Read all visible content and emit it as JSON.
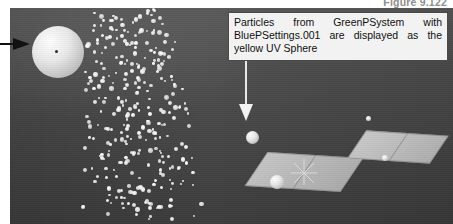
{
  "figure": {
    "caption": "Figure 9.122"
  },
  "viewport": {
    "name": "blender-3d-viewport",
    "background_color": "#4d4d4d",
    "grid_line_color": "#2e2e2e",
    "shading": "solid"
  },
  "callout": {
    "text": "Particles from GreenPSystem with BluePSettings.001 are displayed as the yellow UV Sphere",
    "box_fill": "#f2f2f2",
    "box_border": "#4a4a4a",
    "leader_color": "#e8e8e8"
  },
  "annotations": {
    "left_arrow_label": "left-pointer-arrow",
    "left_arrow_color": "#101010"
  },
  "objects": {
    "emitter_sphere": {
      "label": "uv-sphere-emitter",
      "color": "#eaeaea"
    },
    "particle_instance_sphere": {
      "label": "yellow-uv-sphere-instance",
      "color": "#ececec"
    },
    "plane_left": {
      "label": "plane-left",
      "color": "#bcbcbc"
    },
    "plane_right": {
      "label": "plane-right",
      "color": "#c0c0c0"
    },
    "cursor_3d": {
      "label": "3d-cursor",
      "color": "#d9d9d9"
    }
  },
  "particles": {
    "count": 320,
    "color": "#ededed",
    "system_name": "GreenPSystem",
    "settings_name": "BluePSettings.001"
  }
}
